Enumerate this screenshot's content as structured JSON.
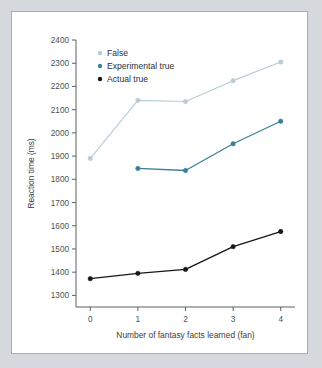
{
  "chart_data": {
    "type": "line",
    "title": "",
    "xlabel": "Number of fantasy facts learned (fan)",
    "ylabel": "Reaction time (ms)",
    "x": [
      0,
      1,
      2,
      3,
      4
    ],
    "xticklabels": [
      "0",
      "1",
      "2",
      "3",
      "4"
    ],
    "xlim": [
      -0.3,
      4.3
    ],
    "ylim": [
      1250,
      2400
    ],
    "yticks": [
      1300,
      1400,
      1500,
      1600,
      1700,
      1800,
      1900,
      2000,
      2100,
      2200,
      2300,
      2400
    ],
    "yticklabels": [
      "1300",
      "1400",
      "1500",
      "1600",
      "1700",
      "1800",
      "1900",
      "2000",
      "2100",
      "2200",
      "2300",
      "2400"
    ],
    "grid": false,
    "legend_position": "upper left",
    "series": [
      {
        "name": "False",
        "color": "#b9ccd6",
        "marker": "circle",
        "x": [
          0,
          1,
          2,
          3,
          4
        ],
        "values": [
          1890,
          2140,
          2135,
          2225,
          2305
        ]
      },
      {
        "name": "Experimental true",
        "color": "#3c7f98",
        "marker": "circle",
        "x": [
          1,
          2,
          3,
          4
        ],
        "values": [
          1847,
          1838,
          1953,
          2050
        ]
      },
      {
        "name": "Actual true",
        "color": "#151719",
        "marker": "circle",
        "x": [
          0,
          1,
          2,
          3,
          4
        ],
        "values": [
          1372,
          1395,
          1412,
          1510,
          1575
        ]
      }
    ]
  },
  "figure": {
    "frame_color": "#8fb6c6",
    "background_color": "#d5d8dc",
    "plot_background": "#ffffff"
  },
  "legend": {
    "items": [
      {
        "label": "False",
        "color": "#b9ccd6"
      },
      {
        "label": "Experimental true",
        "color": "#3c7f98"
      },
      {
        "label": "Actual true",
        "color": "#151719"
      }
    ]
  }
}
